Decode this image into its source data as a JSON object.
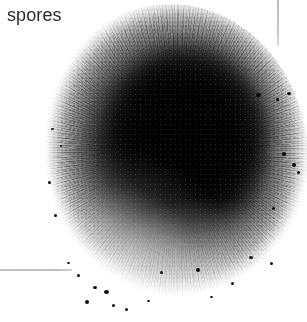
{
  "figure": {
    "width": 307,
    "height": 322,
    "background_color": "#ffffff"
  },
  "labels": [
    {
      "id": "spores",
      "text": "spores",
      "color": "#2b2b2b",
      "font_size_px": 18,
      "x": 7,
      "y": 4
    }
  ],
  "leader_lines": [
    {
      "id": "leader-vertical",
      "orientation": "vertical",
      "color": "#c0c0c0",
      "x": 277,
      "y": 0,
      "length": 46,
      "thickness": 2
    },
    {
      "id": "leader-horizontal",
      "orientation": "horizontal",
      "color": "#c0c0c0",
      "x": 0,
      "y": 269,
      "length": 72,
      "thickness": 2
    }
  ],
  "specimen": {
    "name": "spore-mass",
    "shape": "irregular-sphere",
    "center_x": 172,
    "center_y": 150,
    "radius_x": 136,
    "radius_y": 156,
    "core_color": "#0a0a0a",
    "mid_color": "#4d4d4d",
    "halo_color": "#d6d6d6",
    "edge_texture": "radial-fibrous"
  },
  "specks": [
    {
      "x": 256,
      "y": 93,
      "w": 5,
      "h": 4
    },
    {
      "x": 276,
      "y": 98,
      "w": 3,
      "h": 3
    },
    {
      "x": 287,
      "y": 92,
      "w": 4,
      "h": 3
    },
    {
      "x": 282,
      "y": 152,
      "w": 4,
      "h": 4
    },
    {
      "x": 292,
      "y": 163,
      "w": 4,
      "h": 4
    },
    {
      "x": 297,
      "y": 171,
      "w": 3,
      "h": 3
    },
    {
      "x": 272,
      "y": 207,
      "w": 3,
      "h": 3
    },
    {
      "x": 249,
      "y": 256,
      "w": 4,
      "h": 3
    },
    {
      "x": 270,
      "y": 262,
      "w": 3,
      "h": 3
    },
    {
      "x": 231,
      "y": 282,
      "w": 3,
      "h": 3
    },
    {
      "x": 196,
      "y": 268,
      "w": 4,
      "h": 4
    },
    {
      "x": 160,
      "y": 271,
      "w": 3,
      "h": 3
    },
    {
      "x": 104,
      "y": 290,
      "w": 5,
      "h": 4
    },
    {
      "x": 93,
      "y": 286,
      "w": 4,
      "h": 3
    },
    {
      "x": 85,
      "y": 300,
      "w": 4,
      "h": 4
    },
    {
      "x": 112,
      "y": 304,
      "w": 3,
      "h": 3
    },
    {
      "x": 125,
      "y": 308,
      "w": 3,
      "h": 3
    },
    {
      "x": 77,
      "y": 274,
      "w": 3,
      "h": 3
    },
    {
      "x": 67,
      "y": 262,
      "w": 3,
      "h": 2
    },
    {
      "x": 54,
      "y": 214,
      "w": 3,
      "h": 3
    },
    {
      "x": 48,
      "y": 181,
      "w": 3,
      "h": 3
    },
    {
      "x": 60,
      "y": 145,
      "w": 2,
      "h": 2
    },
    {
      "x": 51,
      "y": 128,
      "w": 3,
      "h": 2
    },
    {
      "x": 147,
      "y": 300,
      "w": 3,
      "h": 2
    },
    {
      "x": 210,
      "y": 296,
      "w": 3,
      "h": 2
    }
  ]
}
